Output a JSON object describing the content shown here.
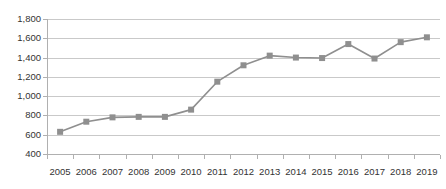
{
  "chart_data": {
    "type": "line",
    "title": "",
    "subtitle": "",
    "xlabel": "",
    "ylabel": "",
    "categories": [
      "2005",
      "2006",
      "2007",
      "2008",
      "2009",
      "2010",
      "2011",
      "2012",
      "2013",
      "2014",
      "2015",
      "2016",
      "2017",
      "2018",
      "2019"
    ],
    "values": [
      630,
      735,
      780,
      785,
      785,
      860,
      1150,
      1320,
      1420,
      1400,
      1395,
      1540,
      1390,
      1560,
      1610
    ],
    "series": [
      {
        "name": "",
        "values": [
          630,
          735,
          780,
          785,
          785,
          860,
          1150,
          1320,
          1420,
          1400,
          1395,
          1540,
          1390,
          1560,
          1610
        ]
      }
    ],
    "ylim": [
      400,
      1800
    ],
    "ytick_values": [
      1800,
      1600,
      1400,
      1200,
      1000,
      800,
      600,
      400
    ],
    "ytick_labels": [
      "1,800",
      "1,600",
      "1,400",
      "1,200",
      "1,000",
      "800",
      "600",
      "400"
    ],
    "xtick_labels": [
      "2005",
      "2006",
      "2007",
      "2008",
      "2009",
      "2010",
      "2011",
      "2012",
      "2013",
      "2014",
      "2015",
      "2016",
      "2017",
      "2018",
      "2019"
    ],
    "grid": true,
    "grid_axis": "y",
    "legend": false,
    "legend_position": "none",
    "marker": "square",
    "colors": {
      "line": "#8f8f8f",
      "marker": "#8f8f8f",
      "gridline": "#c9c9c9",
      "axis": "#b0b0b0",
      "text": "#333333",
      "background": "#ffffff"
    }
  }
}
